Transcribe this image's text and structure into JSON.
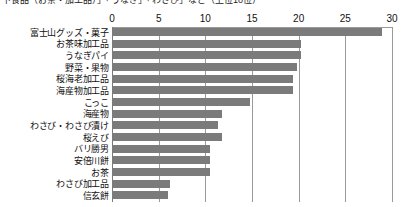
{
  "caption": {
    "text": "下食品（お茶・加工品）」「うなぎ」「わさび」など（上位10位）"
  },
  "chart_data": {
    "type": "bar",
    "orientation": "horizontal",
    "title": "",
    "xlabel": "",
    "ylabel": "",
    "xlim": [
      0,
      30
    ],
    "xticks": [
      0,
      5,
      10,
      15,
      20,
      25,
      30
    ],
    "xtick_labels": [
      "0",
      "5",
      "10",
      "15",
      "20",
      "25",
      "30"
    ],
    "grid": true,
    "legend": false,
    "bar_color": "#7b7b7b",
    "categories": [
      "富士山グッズ・菓子",
      "お茶味加工品",
      "うなぎパイ",
      "野菜・果物",
      "桜海老加工品",
      "海産物加工品",
      "こっこ",
      "海産物",
      "わさび・わさび漬け",
      "桜えび",
      "バリ勝男",
      "安倍川餅",
      "お茶",
      "わさび加工品",
      "信玄餅"
    ],
    "values": [
      28.9,
      20.2,
      20.2,
      19.8,
      19.4,
      19.4,
      14.8,
      11.8,
      11.4,
      11.8,
      10.5,
      10.5,
      10.5,
      6.2,
      6.0
    ]
  }
}
